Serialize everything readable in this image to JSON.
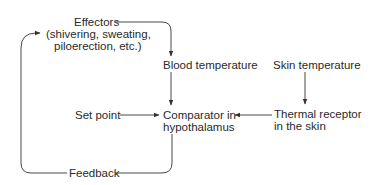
{
  "diagram": {
    "type": "feedback-loop",
    "nodes": {
      "effectors": {
        "title": "Effectors",
        "line2": "(shivering, sweating,",
        "line3": "piloerection, etc.)"
      },
      "blood_temperature": {
        "label": "Blood temperature"
      },
      "skin_temperature": {
        "label": "Skin temperature"
      },
      "set_point": {
        "label": "Set point"
      },
      "comparator": {
        "line1": "Comparator in",
        "line2": "hypothalamus"
      },
      "thermal_receptor": {
        "line1": "Thermal receptor",
        "line2": "in the skin"
      },
      "feedback": {
        "label": "Feedback"
      }
    },
    "edges": [
      {
        "from": "Effectors",
        "to": "Blood temperature"
      },
      {
        "from": "Blood temperature",
        "to": "Comparator in hypothalamus"
      },
      {
        "from": "Skin temperature",
        "to": "Thermal receptor in the skin"
      },
      {
        "from": "Thermal receptor in the skin",
        "to": "Comparator in hypothalamus"
      },
      {
        "from": "Set point",
        "to": "Comparator in hypothalamus"
      },
      {
        "from": "Comparator in hypothalamus",
        "to": "Feedback"
      },
      {
        "from": "Feedback",
        "to": "Effectors"
      }
    ],
    "line_color": "#333333"
  }
}
